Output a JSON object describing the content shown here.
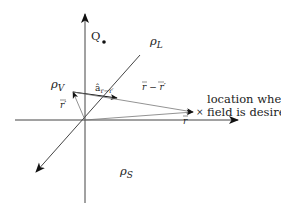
{
  "diagram": {
    "colors": {
      "axis": "#444444",
      "thin_line": "#777777",
      "arrow": "#111111",
      "text": "#222222"
    },
    "labels": {
      "Q": "Q",
      "rho_L": "ρ",
      "rho_L_sub": "L",
      "rho_V": "ρ",
      "rho_V_sub": "V",
      "rho_S": "ρ",
      "rho_S_sub": "S",
      "a_hat": "â",
      "a_hat_sub": "r−r′",
      "r_prime": "r′",
      "r_minus_r_prime": "r − r′",
      "r": "r",
      "target_marker": "×",
      "location_line1": "location where",
      "location_line2": "field is desired"
    },
    "points": {
      "origin": [
        85,
        120
      ],
      "Q_point": [
        104,
        42
      ],
      "rho_V_point": [
        73,
        92
      ],
      "target_point": [
        193,
        112
      ]
    }
  }
}
